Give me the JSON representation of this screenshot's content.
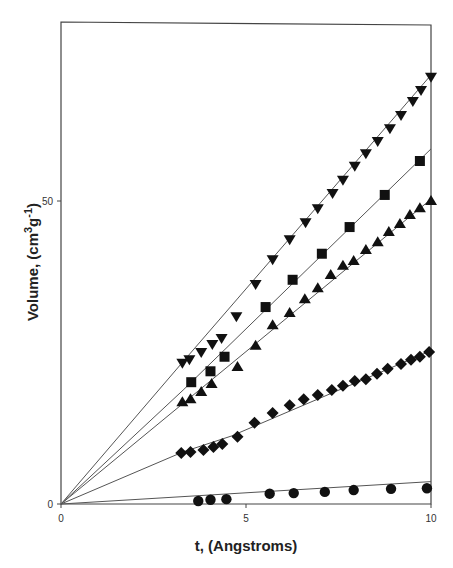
{
  "chart_data": {
    "type": "scatter",
    "title": "",
    "xlabel": "t, (Angstroms)",
    "ylabel_parts": {
      "base": "Volume, (cm",
      "sup1": "3",
      "mid": "g",
      "sup2": "-1",
      "end": ")"
    },
    "ylabel": "Volume, (cm3g-1)",
    "xlim": [
      0,
      10
    ],
    "ylim": [
      0,
      75
    ],
    "x_ticks": [
      0,
      5,
      10
    ],
    "y_ticks": [
      0,
      50
    ],
    "x_tick_labels": [
      "0",
      "5",
      "10"
    ],
    "y_tick_labels": [
      "0",
      "50"
    ],
    "grid": false,
    "legend": "none",
    "series": [
      {
        "name": "triangle-down",
        "marker": "triangle-down",
        "x": [
          3.28,
          3.47,
          3.79,
          4.09,
          4.34,
          4.74,
          5.26,
          5.72,
          6.18,
          6.61,
          6.94,
          7.34,
          7.62,
          7.94,
          8.24,
          8.56,
          8.89,
          9.19,
          9.51,
          9.73,
          10.0
        ],
        "y": [
          23.3,
          23.9,
          25.1,
          26.4,
          27.4,
          31.0,
          36.3,
          40.4,
          43.7,
          46.5,
          48.8,
          51.3,
          53.5,
          55.8,
          57.9,
          59.9,
          62.0,
          64.2,
          66.5,
          68.3,
          70.5
        ],
        "fit": [
          [
            0,
            0
          ],
          [
            3.3,
            23.5
          ],
          [
            10,
            70.8
          ]
        ]
      },
      {
        "name": "square",
        "marker": "square",
        "x": [
          3.52,
          4.04,
          4.42,
          5.53,
          6.26,
          7.05,
          7.8,
          8.75,
          9.7
        ],
        "y": [
          20.1,
          21.9,
          24.3,
          32.5,
          37.0,
          41.3,
          45.7,
          51.0,
          56.6
        ],
        "fit": [
          [
            0,
            0
          ],
          [
            3.3,
            18.8
          ],
          [
            10,
            58.6
          ]
        ]
      },
      {
        "name": "triangle-up",
        "marker": "triangle-up",
        "x": [
          3.28,
          3.5,
          3.79,
          4.07,
          4.77,
          5.26,
          5.72,
          6.18,
          6.59,
          6.94,
          7.29,
          7.62,
          7.91,
          8.24,
          8.56,
          8.86,
          9.16,
          9.43,
          9.7,
          10.0
        ],
        "y": [
          16.8,
          17.3,
          18.5,
          19.8,
          22.6,
          26.1,
          29.5,
          31.5,
          33.8,
          35.6,
          37.8,
          39.3,
          40.1,
          41.9,
          43.2,
          44.9,
          46.2,
          47.7,
          48.8,
          50.0
        ],
        "fit": [
          [
            0,
            0
          ],
          [
            3.3,
            16.6
          ],
          [
            10,
            50.3
          ]
        ]
      },
      {
        "name": "diamond",
        "marker": "diamond",
        "x": [
          3.25,
          3.5,
          3.85,
          4.12,
          4.36,
          4.77,
          5.23,
          5.72,
          6.18,
          6.56,
          6.94,
          7.32,
          7.62,
          7.94,
          8.24,
          8.54,
          8.83,
          9.19,
          9.46,
          9.7,
          9.95
        ],
        "y": [
          8.4,
          8.6,
          8.9,
          9.4,
          9.9,
          11.1,
          13.4,
          15.0,
          16.3,
          17.3,
          18.0,
          18.8,
          19.5,
          20.3,
          20.6,
          21.5,
          22.3,
          23.1,
          23.8,
          24.3,
          25.1
        ],
        "fit": [
          [
            0,
            0
          ],
          [
            3.3,
            8.6
          ],
          [
            4.6,
            11.2
          ],
          [
            10,
            25.3
          ]
        ]
      },
      {
        "name": "circle",
        "marker": "circle",
        "x": [
          3.71,
          4.04,
          4.47,
          5.64,
          6.29,
          7.13,
          7.91,
          8.92,
          9.89
        ],
        "y": [
          0.5,
          0.7,
          0.8,
          1.7,
          1.8,
          2.0,
          2.3,
          2.5,
          2.6
        ],
        "fit": [
          [
            0,
            0
          ],
          [
            10,
            3.7
          ]
        ]
      }
    ]
  },
  "layout": {
    "plot_left": 61,
    "plot_right": 431,
    "plot_top": 22,
    "plot_bottom": 504,
    "y_px_per_unit": 6.06
  }
}
